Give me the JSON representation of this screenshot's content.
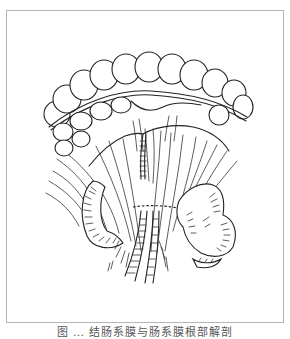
{
  "figure": {
    "illustration": "mesentery-colon-line-drawing",
    "caption": "图 … 结肠系膜与肠系膜根部解剖",
    "frame_color": "#b5b5b5",
    "line_color": "#222222"
  }
}
